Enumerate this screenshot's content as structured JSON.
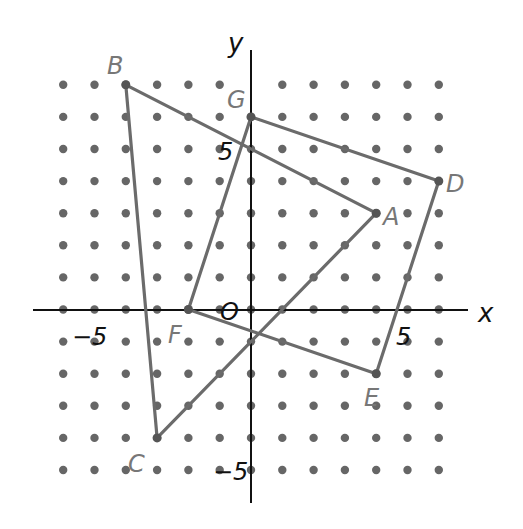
{
  "diagram": {
    "type": "coordinate-grid",
    "axes": {
      "x_label": "x",
      "y_label": "y",
      "origin_label": "O"
    },
    "tick_labels": [
      {
        "text": "−5",
        "axis": "x",
        "value": -5
      },
      {
        "text": "5",
        "axis": "x",
        "value": 5
      },
      {
        "text": "5",
        "axis": "y",
        "value": 5
      },
      {
        "text": "−5",
        "axis": "y",
        "value": -5
      }
    ],
    "grid": {
      "x_min": -6,
      "x_max": 6,
      "y_min": -5,
      "y_max": 7,
      "missing": [
        [
          0,
          7
        ]
      ]
    },
    "points": [
      {
        "name": "A",
        "x": 4,
        "y": 3
      },
      {
        "name": "B",
        "x": -4,
        "y": 7
      },
      {
        "name": "C",
        "x": -3,
        "y": -4
      },
      {
        "name": "D",
        "x": 6,
        "y": 4
      },
      {
        "name": "E",
        "x": 4,
        "y": -2
      },
      {
        "name": "F",
        "x": -2,
        "y": 0
      },
      {
        "name": "G",
        "x": 0,
        "y": 6
      }
    ],
    "polygons": [
      {
        "name": "triangle-ABC",
        "vertices": [
          "A",
          "B",
          "C"
        ]
      },
      {
        "name": "quadrilateral-DEFG",
        "vertices": [
          "G",
          "D",
          "E",
          "F"
        ]
      }
    ],
    "colors": {
      "dots": "#666666",
      "shapes": "#6b6b6b",
      "axes": "#111111",
      "point_labels": "#777777",
      "axis_text": "#111111"
    }
  }
}
